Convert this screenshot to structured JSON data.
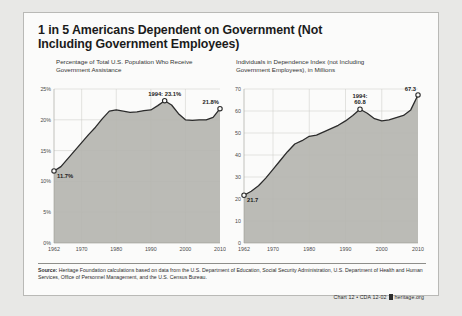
{
  "title": "1 in 5 Americans Dependent on Government (Not Including Government Employees)",
  "panels": {
    "left": {
      "subtitle": "Percentage of Total U.S. Population Who Receive Government Assistance"
    },
    "right": {
      "subtitle": "Individuals in Dependence Index (not Including Government Employees), in Millions"
    }
  },
  "footer": {
    "source_label": "Source:",
    "source_text": " Heritage Foundation calculations based on data from the U.S. Department of Education, Social Security Administration, U.S. Department of Health and Human Services, Office of Personnel Management, and the U.S. Census Bureau.",
    "credit_left": "Chart 12 • CDA 12-02",
    "credit_right": "heritage.org"
  },
  "colors": {
    "page_background": "#e8e8e6",
    "card_background": "#fbfbfa",
    "area_fill": "#b5b5b0",
    "line": "#2b2b2b",
    "grid": "#c9c9c5",
    "text": "#1b1b1b"
  },
  "chart_data": [
    {
      "type": "area",
      "id": "percentage-of-population",
      "title": "Percentage of Total U.S. Population Who Receive Government Assistance",
      "xlabel": "",
      "ylabel": "",
      "xlim": [
        1962,
        2010
      ],
      "ylim": [
        0,
        25
      ],
      "grid": true,
      "legend": "none",
      "ytick_labels": [
        "0%",
        "5%",
        "10%",
        "15%",
        "20%",
        "25%"
      ],
      "ytick_values": [
        0,
        5,
        10,
        15,
        20,
        25
      ],
      "xtick_labels": [
        "1962",
        "1970",
        "1980",
        "1990",
        "2000",
        "2010"
      ],
      "xtick_values": [
        1962,
        1970,
        1980,
        1990,
        2000,
        2010
      ],
      "x": [
        1962,
        1964,
        1966,
        1968,
        1970,
        1972,
        1974,
        1976,
        1978,
        1980,
        1982,
        1984,
        1986,
        1988,
        1990,
        1992,
        1994,
        1996,
        1998,
        2000,
        2002,
        2004,
        2006,
        2008,
        2010
      ],
      "values": [
        11.7,
        12.4,
        13.7,
        15.0,
        16.3,
        17.6,
        18.8,
        20.2,
        21.4,
        21.6,
        21.4,
        21.2,
        21.3,
        21.5,
        21.6,
        22.3,
        23.1,
        22.4,
        21.0,
        20.0,
        19.9,
        20.0,
        20.0,
        20.4,
        21.8
      ],
      "annotations": [
        {
          "label": "11.7%",
          "x": 1962,
          "y": 11.7,
          "marker": "open-circle"
        },
        {
          "label": "1994: 23.1%",
          "x": 1994,
          "y": 23.1,
          "marker": "open-circle"
        },
        {
          "label": "21.8%",
          "x": 2010,
          "y": 21.8,
          "marker": "open-circle"
        }
      ]
    },
    {
      "type": "area",
      "id": "individuals-in-dependence-index",
      "title": "Individuals in Dependence Index (not Including Government Employees), in Millions",
      "xlabel": "",
      "ylabel": "",
      "xlim": [
        1962,
        2010
      ],
      "ylim": [
        0,
        70
      ],
      "grid": true,
      "legend": "none",
      "ytick_labels": [
        "0",
        "10",
        "20",
        "30",
        "40",
        "50",
        "60",
        "70"
      ],
      "ytick_values": [
        0,
        10,
        20,
        30,
        40,
        50,
        60,
        70
      ],
      "xtick_labels": [
        "1962",
        "1970",
        "1980",
        "1990",
        "2000",
        "2010"
      ],
      "xtick_values": [
        1962,
        1970,
        1980,
        1990,
        2000,
        2010
      ],
      "x": [
        1962,
        1964,
        1966,
        1968,
        1970,
        1972,
        1974,
        1976,
        1978,
        1980,
        1982,
        1984,
        1986,
        1988,
        1990,
        1992,
        1994,
        1996,
        1998,
        2000,
        2002,
        2004,
        2006,
        2008,
        2010
      ],
      "values": [
        21.7,
        23.5,
        26.0,
        29.5,
        33.5,
        37.5,
        41.5,
        45.0,
        46.5,
        48.5,
        49.0,
        50.5,
        52.0,
        53.5,
        55.5,
        58.0,
        60.8,
        59.0,
        56.5,
        55.5,
        56.0,
        57.0,
        58.0,
        60.5,
        67.3
      ],
      "annotations": [
        {
          "label": "21.7",
          "x": 1962,
          "y": 21.7,
          "marker": "open-circle"
        },
        {
          "label": "1994:",
          "label2": "60.8",
          "x": 1994,
          "y": 60.8,
          "marker": "open-circle"
        },
        {
          "label": "67.3",
          "x": 2010,
          "y": 67.3,
          "marker": "open-circle"
        }
      ]
    }
  ]
}
